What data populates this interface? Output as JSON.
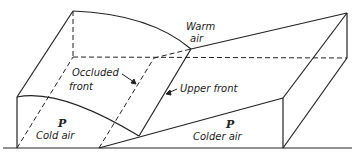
{
  "labels": {
    "warm_air_1": "Warm",
    "warm_air_2": "air",
    "occluded_1": "Occluded",
    "occluded_2": "front",
    "upper_front": "Upper front",
    "cold_p": "P",
    "cold_air": "Cold air",
    "colder_p": "P",
    "colder_air": "Colder air"
  },
  "colors": {
    "line": "#222222",
    "background": "#ffffff"
  }
}
